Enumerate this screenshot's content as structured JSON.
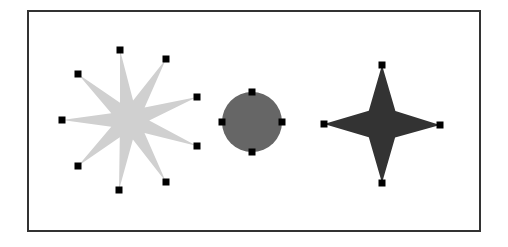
{
  "figure": {
    "frame": {
      "x": 28,
      "y": 11,
      "width": 452,
      "height": 220,
      "stroke": "#333333"
    },
    "handle_size": 7,
    "handle_color": "#000000",
    "shapes": [
      {
        "name": "nine-point-star",
        "fill": "#d0d0d0",
        "center": [
          129,
          120
        ],
        "handles": [
          [
            120,
            50
          ],
          [
            166,
            59
          ],
          [
            78,
            74
          ],
          [
            197,
            97
          ],
          [
            62,
            120
          ],
          [
            197,
            146
          ],
          [
            78,
            166
          ],
          [
            166,
            182
          ],
          [
            119,
            190
          ]
        ]
      },
      {
        "name": "circle",
        "fill": "#666666",
        "center": [
          252,
          122
        ],
        "radius": 30,
        "handles": [
          [
            252,
            92
          ],
          [
            222,
            122
          ],
          [
            282,
            122
          ],
          [
            252,
            152
          ]
        ]
      },
      {
        "name": "four-point-star",
        "fill": "#333333",
        "center": [
          382,
          124
        ],
        "handles": [
          [
            382,
            65
          ],
          [
            324,
            124
          ],
          [
            440,
            125
          ],
          [
            382,
            183
          ]
        ]
      }
    ]
  }
}
